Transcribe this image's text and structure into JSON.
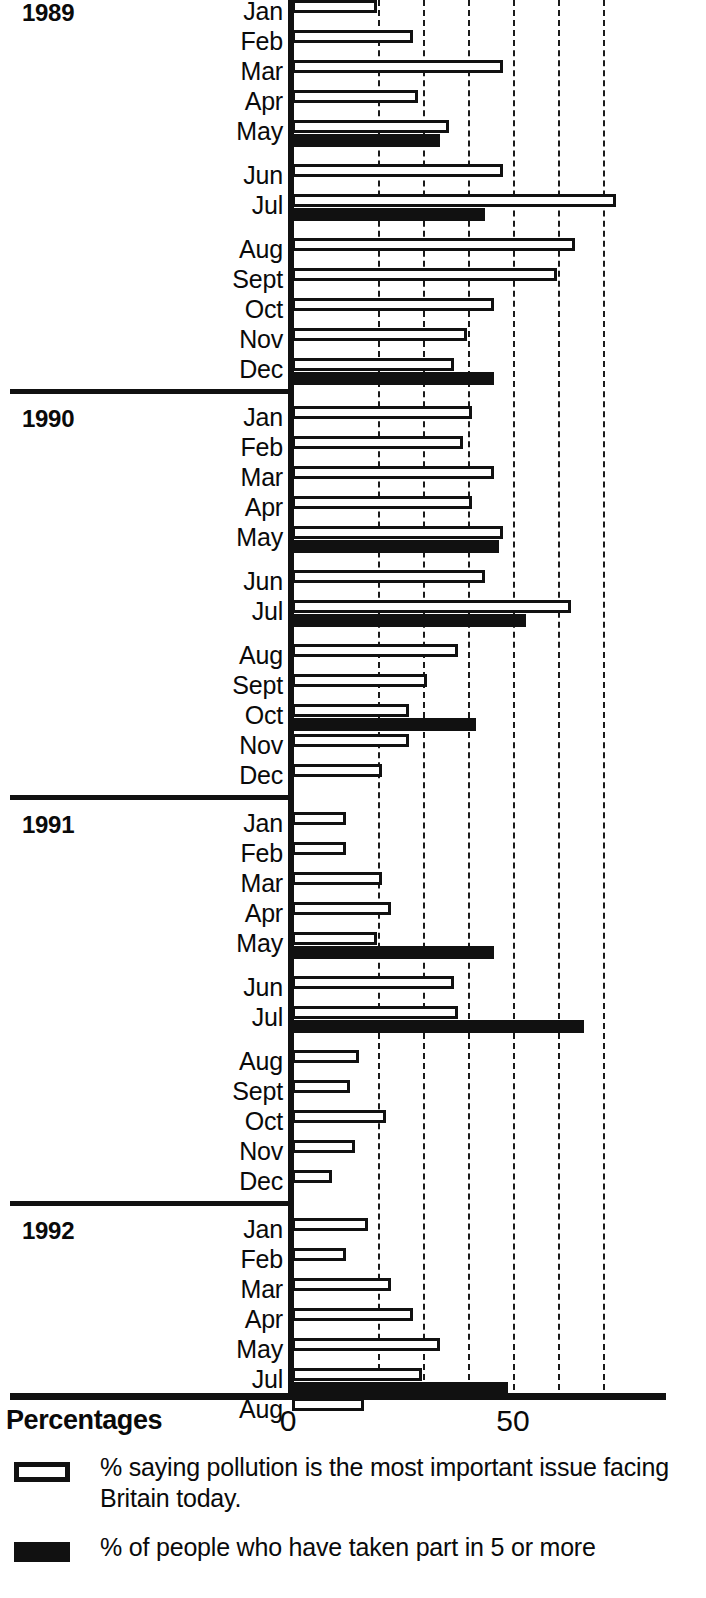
{
  "axis": {
    "title": "Percentages",
    "ticks": [
      {
        "label": "0",
        "value": 0
      },
      {
        "label": "50",
        "value": 50
      }
    ]
  },
  "legend": {
    "items": [
      {
        "swatch": "open-rectangle",
        "label": "% saying pollution is the most important issue facing Britain today."
      },
      {
        "swatch": "filled-rectangle",
        "label": "% of people who have taken part in 5 or more"
      }
    ]
  },
  "years": [
    {
      "label": "1989"
    },
    {
      "label": "1990"
    },
    {
      "label": "1991"
    },
    {
      "label": "1992"
    }
  ],
  "chart_data": {
    "type": "bar",
    "orientation": "horizontal",
    "title": "",
    "xlabel": "Percentages",
    "ylabel": "",
    "xlim": [
      0,
      75
    ],
    "grid": true,
    "gridline_interval": 10,
    "legend_position": "bottom",
    "series": [
      {
        "name": "% saying pollution is the most important issue facing Britain today.",
        "style": "open"
      },
      {
        "name": "% of people who have taken part in 5 or more",
        "style": "filled"
      }
    ],
    "groups": [
      {
        "year": "1989",
        "rows": [
          {
            "month": "Jan",
            "white": 18,
            "black": null,
            "gap_after": false
          },
          {
            "month": "Feb",
            "white": 26,
            "black": null,
            "gap_after": false
          },
          {
            "month": "Mar",
            "white": 46,
            "black": null,
            "gap_after": false
          },
          {
            "month": "Apr",
            "white": 27,
            "black": null,
            "gap_after": false
          },
          {
            "month": "May",
            "white": 34,
            "black": 32,
            "gap_after": true
          },
          {
            "month": "Jun",
            "white": 46,
            "black": null,
            "gap_after": false
          },
          {
            "month": "Jul",
            "white": 71,
            "black": 42,
            "gap_after": true
          },
          {
            "month": "Aug",
            "white": 62,
            "black": null,
            "gap_after": false
          },
          {
            "month": "Sept",
            "white": 58,
            "black": null,
            "gap_after": false
          },
          {
            "month": "Oct",
            "white": 44,
            "black": null,
            "gap_after": false
          },
          {
            "month": "Nov",
            "white": 38,
            "black": null,
            "gap_after": false
          },
          {
            "month": "Dec",
            "white": 35,
            "black": 44,
            "gap_after": false
          }
        ]
      },
      {
        "year": "1990",
        "rows": [
          {
            "month": "Jan",
            "white": 39,
            "black": null,
            "gap_after": false
          },
          {
            "month": "Feb",
            "white": 37,
            "black": null,
            "gap_after": false
          },
          {
            "month": "Mar",
            "white": 44,
            "black": null,
            "gap_after": false
          },
          {
            "month": "Apr",
            "white": 39,
            "black": null,
            "gap_after": false
          },
          {
            "month": "May",
            "white": 46,
            "black": 45,
            "gap_after": true
          },
          {
            "month": "Jun",
            "white": 42,
            "black": null,
            "gap_after": false
          },
          {
            "month": "Jul",
            "white": 61,
            "black": 51,
            "gap_after": true
          },
          {
            "month": "Aug",
            "white": 36,
            "black": null,
            "gap_after": false
          },
          {
            "month": "Sept",
            "white": 29,
            "black": null,
            "gap_after": false
          },
          {
            "month": "Oct",
            "white": 25,
            "black": 40,
            "gap_after": false
          },
          {
            "month": "Nov",
            "white": 25,
            "black": null,
            "gap_after": false
          },
          {
            "month": "Dec",
            "white": 19,
            "black": null,
            "gap_after": false
          }
        ]
      },
      {
        "year": "1991",
        "rows": [
          {
            "month": "Jan",
            "white": 11,
            "black": null,
            "gap_after": false
          },
          {
            "month": "Feb",
            "white": 11,
            "black": null,
            "gap_after": false
          },
          {
            "month": "Mar",
            "white": 19,
            "black": null,
            "gap_after": false
          },
          {
            "month": "Apr",
            "white": 21,
            "black": null,
            "gap_after": false
          },
          {
            "month": "May",
            "white": 18,
            "black": 44,
            "gap_after": true
          },
          {
            "month": "Jun",
            "white": 35,
            "black": null,
            "gap_after": false
          },
          {
            "month": "Jul",
            "white": 36,
            "black": 64,
            "gap_after": true
          },
          {
            "month": "Aug",
            "white": 14,
            "black": null,
            "gap_after": false
          },
          {
            "month": "Sept",
            "white": 12,
            "black": null,
            "gap_after": false
          },
          {
            "month": "Oct",
            "white": 20,
            "black": null,
            "gap_after": false
          },
          {
            "month": "Nov",
            "white": 13,
            "black": null,
            "gap_after": false
          },
          {
            "month": "Dec",
            "white": 8,
            "black": null,
            "gap_after": false
          }
        ]
      },
      {
        "year": "1992",
        "rows": [
          {
            "month": "Jan",
            "white": 16,
            "black": null,
            "gap_after": false
          },
          {
            "month": "Feb",
            "white": 11,
            "black": null,
            "gap_after": false
          },
          {
            "month": "Mar",
            "white": 21,
            "black": null,
            "gap_after": false
          },
          {
            "month": "Apr",
            "white": 26,
            "black": null,
            "gap_after": false
          },
          {
            "month": "May",
            "white": 32,
            "black": null,
            "gap_after": false
          },
          {
            "month": "Jul",
            "white": 28,
            "black": 47,
            "gap_after": false
          },
          {
            "month": "Aug",
            "white": 15,
            "black": null,
            "gap_after": false
          }
        ]
      }
    ]
  }
}
